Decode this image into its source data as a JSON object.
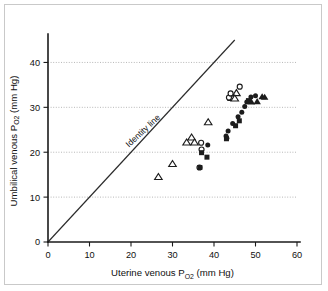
{
  "figure": {
    "border_color": "#c9c9c9",
    "background": "#ffffff"
  },
  "chart_data": {
    "type": "scatter",
    "title": "",
    "xlabel_main": "Uterine venous P",
    "xlabel_sub": "O2",
    "xlabel_unit": " (mm Hg)",
    "ylabel_main": "Umbilical venous P",
    "ylabel_sub": "O2",
    "ylabel_unit": " (mm Hg)",
    "xlabel": "Uterine venous PO2 (mm Hg)",
    "ylabel": "Umbilical venous PO2 (mm Hg)",
    "xlim": [
      0,
      60
    ],
    "ylim": [
      0,
      45
    ],
    "xticks": [
      0,
      10,
      20,
      30,
      40,
      50,
      60
    ],
    "yticks": [
      0,
      10,
      20,
      30,
      40
    ],
    "xtick_labels": [
      "0",
      "10",
      "20",
      "30",
      "40",
      "50",
      "60"
    ],
    "ytick_labels": [
      "0",
      "10",
      "20",
      "30",
      "40"
    ],
    "grid": "horizontal-dotted",
    "legend": "none",
    "annotations": [
      {
        "name": "identity-line-label",
        "text": "Identity line",
        "x": 19.5,
        "y": 21.0,
        "rotation": -43
      }
    ],
    "reference_lines": [
      {
        "name": "identity-line",
        "kind": "y=x",
        "x_from": 0,
        "y_from": 0,
        "x_to": 45,
        "y_to": 45
      }
    ],
    "series": [
      {
        "name": "open-triangle",
        "marker": "triangle-open",
        "color": "#1c1c1c",
        "points": [
          [
            26.6,
            14.5
          ],
          [
            30.0,
            17.4
          ],
          [
            33.4,
            22.2
          ],
          [
            34.6,
            23.3
          ],
          [
            35.3,
            22.2
          ],
          [
            38.6,
            26.7
          ],
          [
            44.3,
            32.1
          ],
          [
            45.4,
            33.2
          ],
          [
            45.0,
            32.0
          ]
        ]
      },
      {
        "name": "open-circle",
        "marker": "circle-open",
        "color": "#1c1c1c",
        "points": [
          [
            36.5,
            16.6
          ],
          [
            36.9,
            22.1
          ],
          [
            37.0,
            20.6
          ],
          [
            43.6,
            32.2
          ],
          [
            44.0,
            33.1
          ],
          [
            46.2,
            34.6
          ]
        ]
      },
      {
        "name": "filled-circle",
        "marker": "circle-filled",
        "color": "#1c1c1c",
        "points": [
          [
            38.5,
            21.6
          ],
          [
            42.9,
            23.6
          ],
          [
            43.4,
            24.7
          ],
          [
            44.5,
            26.4
          ],
          [
            45.8,
            27.9
          ],
          [
            46.7,
            28.9
          ],
          [
            47.4,
            30.2
          ],
          [
            47.9,
            31.2
          ],
          [
            48.9,
            32.3
          ],
          [
            50.0,
            32.6
          ],
          [
            43.1,
            23.1
          ]
        ]
      },
      {
        "name": "filled-square",
        "marker": "square-filled",
        "color": "#1c1c1c",
        "points": [
          [
            36.6,
            16.6
          ],
          [
            37.0,
            19.9
          ],
          [
            38.3,
            18.9
          ],
          [
            43.0,
            23.0
          ],
          [
            45.2,
            25.9
          ],
          [
            46.1,
            27.0
          ],
          [
            48.3,
            31.5
          ]
        ]
      },
      {
        "name": "filled-triangle",
        "marker": "triangle-filled",
        "color": "#1c1c1c",
        "points": [
          [
            49.0,
            31.2
          ],
          [
            50.4,
            31.3
          ],
          [
            51.6,
            32.4
          ],
          [
            52.2,
            32.3
          ]
        ]
      }
    ]
  }
}
